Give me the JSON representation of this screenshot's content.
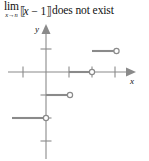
{
  "caption": {
    "limit_word": "lim",
    "limit_subscript_var": "x",
    "limit_subscript_arrow": "→",
    "limit_subscript_target": "n",
    "bracket_open": "⟦",
    "bracket_close": "⟧",
    "expression_var": "x",
    "expression_operator": "−",
    "expression_constant": "1",
    "conclusion": "does not exist"
  },
  "graph": {
    "x_axis_label": "x",
    "y_axis_label": "y",
    "colors": {
      "axis": "#8a8a8a",
      "curve": "#8a8a8a",
      "open_circle_fill": "#ffffff",
      "background": "#ffffff",
      "text": "#111111"
    },
    "origin_px": {
      "x": 46,
      "y": 54
    },
    "unit_px": 23,
    "x_ticks": [
      -1,
      1,
      2,
      3
    ],
    "y_ticks": [
      1,
      -1,
      -2,
      -3
    ],
    "segments": [
      {
        "name": "segment-y2",
        "y": 2,
        "x_start": 3,
        "x_end": 4,
        "right_endpoint": "open"
      },
      {
        "name": "segment-y0",
        "y": 0,
        "x_start": 1,
        "x_end": 2,
        "right_endpoint": "open"
      },
      {
        "name": "segment-y-1",
        "y": -1,
        "x_start": 0,
        "x_end": 1,
        "right_endpoint": "open"
      },
      {
        "name": "segment-y-2",
        "y": -2,
        "x_start": -1.5,
        "x_end": 0,
        "right_endpoint": "open"
      }
    ]
  }
}
